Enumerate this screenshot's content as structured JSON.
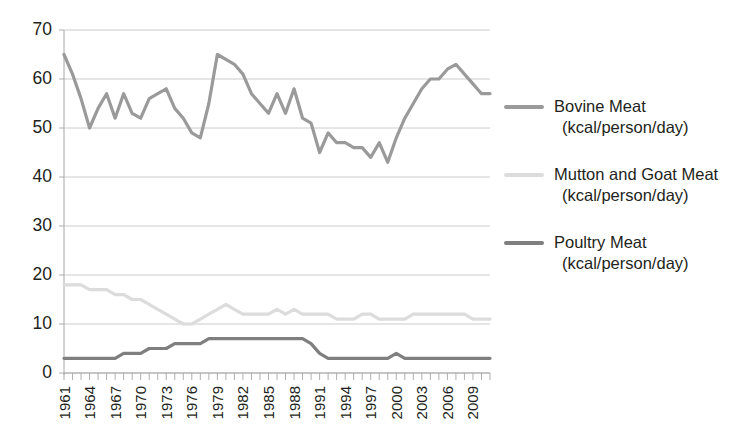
{
  "chart_data": {
    "type": "line",
    "title": "",
    "xlabel": "",
    "ylabel": "",
    "ylim": [
      0,
      70
    ],
    "y_ticks": [
      0,
      10,
      20,
      30,
      40,
      50,
      60,
      70
    ],
    "grid": true,
    "legend_position": "right",
    "x_tick_labels": [
      "1961",
      "1964",
      "1967",
      "1970",
      "1973",
      "1976",
      "1979",
      "1982",
      "1985",
      "1988",
      "1991",
      "1994",
      "1997",
      "2000",
      "2003",
      "2006",
      "2009"
    ],
    "x": [
      1961,
      1962,
      1963,
      1964,
      1965,
      1966,
      1967,
      1968,
      1969,
      1970,
      1971,
      1972,
      1973,
      1974,
      1975,
      1976,
      1977,
      1978,
      1979,
      1980,
      1981,
      1982,
      1983,
      1984,
      1985,
      1986,
      1987,
      1988,
      1989,
      1990,
      1991,
      1992,
      1993,
      1994,
      1995,
      1996,
      1997,
      1998,
      1999,
      2000,
      2001,
      2002,
      2003,
      2004,
      2005,
      2006,
      2007,
      2008,
      2009,
      2010,
      2011
    ],
    "series": [
      {
        "name": "Bovine Meat",
        "unit": "(kcal/person/day)",
        "color": "#9a9a9a",
        "values": [
          65,
          61,
          56,
          50,
          54,
          57,
          52,
          57,
          53,
          52,
          56,
          57,
          58,
          54,
          52,
          49,
          48,
          55,
          65,
          64,
          63,
          61,
          57,
          55,
          53,
          57,
          53,
          58,
          52,
          51,
          45,
          49,
          47,
          47,
          46,
          46,
          44,
          47,
          43,
          48,
          52,
          55,
          58,
          60,
          60,
          62,
          63,
          61,
          59,
          57,
          57
        ]
      },
      {
        "name": "Mutton and Goat Meat",
        "unit": "(kcal/person/day)",
        "color": "#dcdcdc",
        "values": [
          18,
          18,
          18,
          17,
          17,
          17,
          16,
          16,
          15,
          15,
          14,
          13,
          12,
          11,
          10,
          10,
          11,
          12,
          13,
          14,
          13,
          12,
          12,
          12,
          12,
          13,
          12,
          13,
          12,
          12,
          12,
          12,
          11,
          11,
          11,
          12,
          12,
          11,
          11,
          11,
          11,
          12,
          12,
          12,
          12,
          12,
          12,
          12,
          11,
          11,
          11
        ]
      },
      {
        "name": "Poultry Meat",
        "unit": "(kcal/person/day)",
        "color": "#7f7f7f",
        "values": [
          3,
          3,
          3,
          3,
          3,
          3,
          3,
          4,
          4,
          4,
          5,
          5,
          5,
          6,
          6,
          6,
          6,
          7,
          7,
          7,
          7,
          7,
          7,
          7,
          7,
          7,
          7,
          7,
          7,
          6,
          4,
          3,
          3,
          3,
          3,
          3,
          3,
          3,
          3,
          4,
          3,
          3,
          3,
          3,
          3,
          3,
          3,
          3,
          3,
          3,
          3
        ]
      }
    ]
  },
  "legend": {
    "entries": [
      {
        "label": "Bovine Meat",
        "unit": "(kcal/person/day)"
      },
      {
        "label": "Mutton and Goat Meat",
        "unit": "(kcal/person/day)"
      },
      {
        "label": "Poultry Meat",
        "unit": "(kcal/person/day)"
      }
    ]
  }
}
